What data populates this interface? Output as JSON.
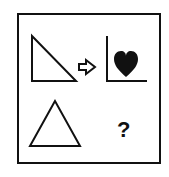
{
  "puzzle": {
    "type": "analogy",
    "top_left": "right-triangle",
    "relation": "arrow-right",
    "top_right": "heart-with-axes",
    "bottom_left": "triangle",
    "bottom_right": "?"
  },
  "colors": {
    "stroke": "#111111",
    "fill": "#111111",
    "background": "#ffffff"
  }
}
